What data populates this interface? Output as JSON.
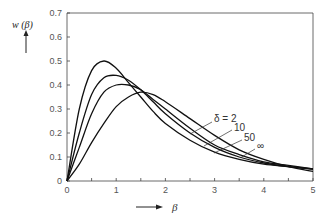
{
  "chart_data": {
    "type": "line",
    "title": "",
    "xlabel": "β",
    "ylabel": "w(β)",
    "xlim": [
      0,
      5
    ],
    "ylim": [
      0,
      0.7
    ],
    "x_ticks": [
      "0",
      "1",
      "2",
      "3",
      "4",
      "5"
    ],
    "y_ticks": [
      "0",
      "0.1",
      "0.2",
      "0.3",
      "0.4",
      "0.5",
      "0.6",
      "0.7"
    ],
    "grid": false,
    "legend": "inline annotations",
    "annotations": [
      "δ = 2",
      "10",
      "50",
      "∞"
    ],
    "x": [
      0,
      0.25,
      0.5,
      0.75,
      1.0,
      1.25,
      1.5,
      1.75,
      2.0,
      2.5,
      3.0,
      3.5,
      4.0,
      4.5,
      5.0
    ],
    "series": [
      {
        "name": "δ = 2",
        "values": [
          0,
          0.3,
          0.46,
          0.5,
          0.47,
          0.41,
          0.35,
          0.29,
          0.24,
          0.17,
          0.12,
          0.09,
          0.07,
          0.06,
          0.05
        ]
      },
      {
        "name": "δ = 10",
        "values": [
          0,
          0.2,
          0.36,
          0.43,
          0.44,
          0.42,
          0.38,
          0.33,
          0.28,
          0.2,
          0.14,
          0.1,
          0.075,
          0.06,
          0.05
        ]
      },
      {
        "name": "δ = 50",
        "values": [
          0,
          0.14,
          0.28,
          0.37,
          0.4,
          0.4,
          0.38,
          0.34,
          0.3,
          0.22,
          0.15,
          0.11,
          0.08,
          0.065,
          0.05
        ]
      },
      {
        "name": "δ = ∞",
        "values": [
          0,
          0.07,
          0.16,
          0.24,
          0.31,
          0.35,
          0.37,
          0.36,
          0.33,
          0.26,
          0.19,
          0.13,
          0.09,
          0.06,
          0.04
        ]
      }
    ]
  },
  "labels": {
    "ylabel": "w (β)",
    "xlabel": "β",
    "ann": [
      "δ = 2",
      "10",
      "50",
      "∞"
    ]
  }
}
